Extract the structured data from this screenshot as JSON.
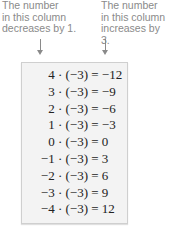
{
  "annotations": {
    "left": [
      "The number",
      "in this column",
      "decreases by 1."
    ],
    "right": [
      "The number",
      "in this column",
      "increases by 3."
    ]
  },
  "equations": [
    {
      "lhs": "4 · (−3)",
      "rhs": " = −12"
    },
    {
      "lhs": "3 · (−3)",
      "rhs": " = −9"
    },
    {
      "lhs": "2 · (−3)",
      "rhs": " = −6"
    },
    {
      "lhs": "1 · (−3)",
      "rhs": " = −3"
    },
    {
      "lhs": "0 · (−3)",
      "rhs": " = 0"
    },
    {
      "lhs": "−1 · (−3)",
      "rhs": " = 3"
    },
    {
      "lhs": "−2 · (−3)",
      "rhs": " = 6"
    },
    {
      "lhs": "−3 · (−3)",
      "rhs": " = 9"
    },
    {
      "lhs": "−4 · (−3)",
      "rhs": " = 12"
    }
  ]
}
